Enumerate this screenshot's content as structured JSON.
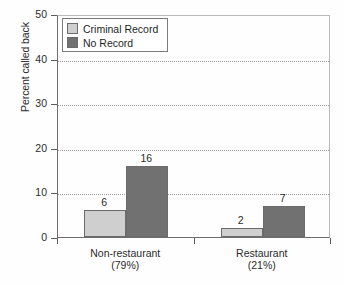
{
  "chart_data": {
    "type": "bar",
    "title": "",
    "subtitle": "",
    "xlabel": "",
    "ylabel": "Percent called back",
    "ylim": [
      0,
      50
    ],
    "yticks": [
      0,
      10,
      20,
      30,
      40,
      50
    ],
    "ytick_labels": [
      "0",
      "10",
      "20",
      "30",
      "40",
      "50"
    ],
    "grid": "horizontal-dotted",
    "legend_position": "upper-left-inside",
    "categories": [
      "Non-restaurant",
      "Restaurant"
    ],
    "category_sublabels": [
      "(79%)",
      "(21%)"
    ],
    "series": [
      {
        "name": "Criminal Record",
        "color": "#cfcfcf",
        "values": [
          6,
          2
        ],
        "value_labels": [
          "6",
          "2"
        ]
      },
      {
        "name": "No Record",
        "color": "#717171",
        "values": [
          16,
          7
        ],
        "value_labels": [
          "16",
          "7"
        ]
      }
    ]
  },
  "legend": {
    "items": [
      {
        "label": "Criminal Record",
        "swatch": "light"
      },
      {
        "label": "No Record",
        "swatch": "dark"
      }
    ]
  },
  "axes": {
    "y_title": "Percent called back"
  },
  "caption": {
    "text": ""
  }
}
